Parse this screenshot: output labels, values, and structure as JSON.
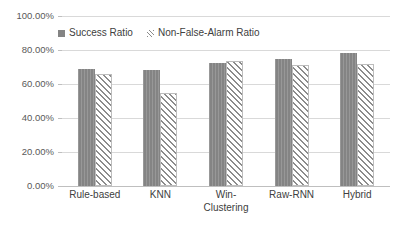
{
  "chart_data": {
    "type": "bar",
    "title": "",
    "xlabel": "",
    "ylabel": "",
    "categories": [
      "Rule-based",
      "KNN",
      "Win-\nClustering",
      "Raw-RNN",
      "Hybrid"
    ],
    "series": [
      {
        "name": "Success Ratio",
        "swatch": "solid",
        "color": "#848484",
        "values": [
          0.69,
          0.68,
          0.725,
          0.75,
          0.78
        ]
      },
      {
        "name": "Non-False-Alarm Ratio",
        "swatch": "hatched",
        "color": "#8c8c8c",
        "values": [
          0.66,
          0.55,
          0.735,
          0.71,
          0.72
        ]
      }
    ],
    "ylim": [
      0,
      1
    ],
    "ytick_values": [
      0,
      0.2,
      0.4,
      0.6,
      0.8,
      1.0
    ],
    "ytick_labels": [
      "0.00%",
      "20.00%",
      "40.00%",
      "60.00%",
      "80.00%",
      "100.00%"
    ],
    "grid": true,
    "legend_position": "top-left-inside",
    "background_color": "#ffffff",
    "gridline_color": "#d9d9d9"
  },
  "legend": {
    "entries": [
      {
        "label": "Success Ratio"
      },
      {
        "label": "Non-False-Alarm Ratio"
      }
    ]
  }
}
